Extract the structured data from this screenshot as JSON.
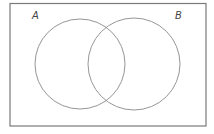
{
  "diagram": {
    "type": "venn",
    "sets": [
      {
        "label": "A",
        "center": [
          80,
          64
        ],
        "radius": 45
      },
      {
        "label": "B",
        "center": [
          134,
          64
        ],
        "radius": 46
      }
    ],
    "frame": {
      "x": 10,
      "y": 3,
      "width": 196,
      "height": 123
    },
    "colors": {
      "stroke": "#8a8a8a",
      "frame": "#7a7a7a",
      "label": "#444444"
    }
  }
}
